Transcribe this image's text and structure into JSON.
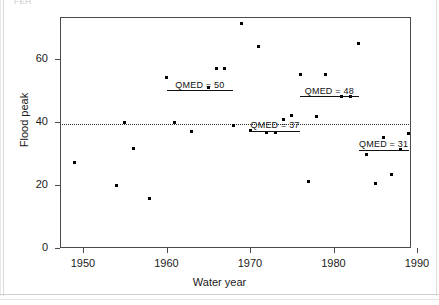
{
  "figure": {
    "corner_note": "FEH",
    "background": "#ffffff",
    "point_color": "#000000",
    "axis_color": "#4a4a4a"
  },
  "chart_data": {
    "type": "scatter",
    "title": "",
    "xlabel": "Water year",
    "ylabel": "Flood peak",
    "xlim": [
      1947,
      1991
    ],
    "ylim": [
      0,
      72
    ],
    "xticks": [
      1950,
      1960,
      1970,
      1980,
      1990
    ],
    "yticks": [
      0,
      20,
      40,
      60
    ],
    "grid": false,
    "legend": "none",
    "reference_line": {
      "name": "overall-median",
      "orientation": "horizontal",
      "value": 39.5,
      "style": "dotted"
    },
    "points": [
      {
        "x": 1949,
        "y": 27.0
      },
      {
        "x": 1954,
        "y": 19.8
      },
      {
        "x": 1955,
        "y": 39.7
      },
      {
        "x": 1956,
        "y": 31.5
      },
      {
        "x": 1958,
        "y": 15.7
      },
      {
        "x": 1960,
        "y": 54.0
      },
      {
        "x": 1961,
        "y": 39.7
      },
      {
        "x": 1963,
        "y": 37.0
      },
      {
        "x": 1965,
        "y": 51.0
      },
      {
        "x": 1966,
        "y": 57.0
      },
      {
        "x": 1967,
        "y": 57.0
      },
      {
        "x": 1968,
        "y": 38.8
      },
      {
        "x": 1969,
        "y": 71.3
      },
      {
        "x": 1970,
        "y": 37.2
      },
      {
        "x": 1971,
        "y": 64.0
      },
      {
        "x": 1972,
        "y": 36.8
      },
      {
        "x": 1973,
        "y": 36.8
      },
      {
        "x": 1974,
        "y": 40.8
      },
      {
        "x": 1975,
        "y": 42.2
      },
      {
        "x": 1976,
        "y": 55.0
      },
      {
        "x": 1977,
        "y": 21.0
      },
      {
        "x": 1978,
        "y": 41.8
      },
      {
        "x": 1979,
        "y": 55.0
      },
      {
        "x": 1981,
        "y": 48.0
      },
      {
        "x": 1982,
        "y": 48.0
      },
      {
        "x": 1983,
        "y": 65.0
      },
      {
        "x": 1984,
        "y": 29.8
      },
      {
        "x": 1985,
        "y": 20.5
      },
      {
        "x": 1986,
        "y": 35.0
      },
      {
        "x": 1987,
        "y": 23.2
      },
      {
        "x": 1988,
        "y": 31.3
      },
      {
        "x": 1989,
        "y": 36.2
      }
    ],
    "annotations": [
      {
        "name": "qmed-50",
        "label": "QMED = 50",
        "value": 50,
        "x_start": 1960,
        "x_end": 1968,
        "y": 50
      },
      {
        "name": "qmed-48",
        "label": "QMED = 48",
        "value": 48,
        "x_start": 1976,
        "x_end": 1983,
        "y": 48
      },
      {
        "name": "qmed-37",
        "label": "QMED = 37",
        "value": 37,
        "x_start": 1970,
        "x_end": 1976,
        "y": 37
      },
      {
        "name": "qmed-31",
        "label": "QMED = 31",
        "value": 31,
        "x_start": 1983,
        "x_end": 1989,
        "y": 31
      }
    ]
  }
}
